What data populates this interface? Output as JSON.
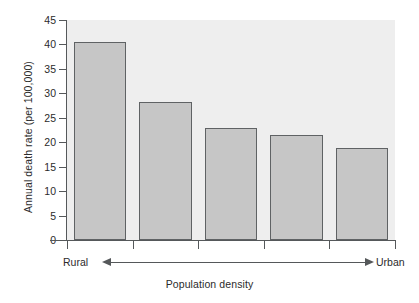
{
  "chart_data": {
    "type": "bar",
    "title": "",
    "xlabel": "Population density",
    "ylabel": "Annual death rate (per 100,000)",
    "categories": [
      "1",
      "2",
      "3",
      "4",
      "5"
    ],
    "values": [
      40.4,
      28.3,
      23.0,
      21.4,
      18.9
    ],
    "ylim": [
      0,
      45
    ],
    "yticks": [
      0,
      5,
      10,
      15,
      20,
      25,
      30,
      35,
      40,
      45
    ],
    "ytick_labels": [
      "0",
      "5",
      "10",
      "15",
      "20",
      "25",
      "30",
      "35",
      "40",
      "45"
    ],
    "grid": false,
    "legend": "none",
    "axis_annotations": {
      "left_end_label": "Rural",
      "right_end_label": "Urban",
      "arrow": "double-headed"
    },
    "colors": {
      "bar_fill": "#c6c6c6",
      "bar_edge": "#5f6264",
      "plot_background": "#eeeeee",
      "axis": "#55585a",
      "text": "#2b2b2b",
      "figure_background": "#ffffff"
    }
  }
}
